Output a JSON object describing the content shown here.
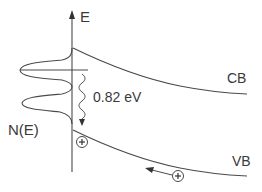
{
  "diagram": {
    "axis_label": "E",
    "dos_label": "N(E)",
    "conduction_band_label": "CB",
    "valence_band_label": "VB",
    "transition_energy_label": "0.82 eV",
    "hole_symbol": "+",
    "colors": {
      "line": "#4a4a4a",
      "text": "#3a3a3a",
      "background": "#ffffff"
    }
  }
}
